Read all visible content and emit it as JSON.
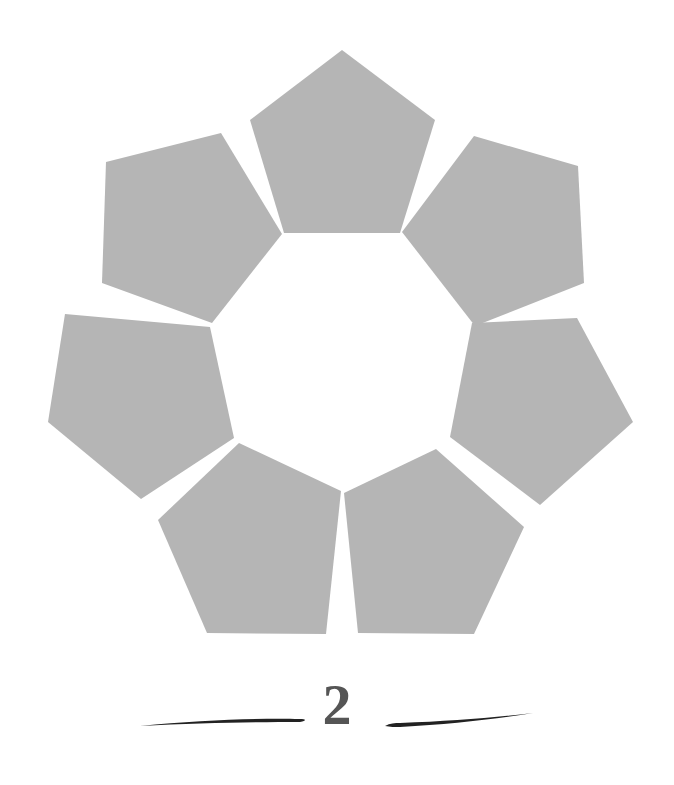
{
  "figure": {
    "shape": "pentagon",
    "count": 7,
    "fill_color": "#b5b5b5",
    "background_color": "#ffffff",
    "center": [
      341,
      335
    ],
    "pentagons": [
      {
        "points": "342,50 435,120 400,233 284,233 250,120"
      },
      {
        "points": "106,162 221,133 282,234 212,323 102,283"
      },
      {
        "points": "48,422 65,314 210,327 234,438 141,499"
      },
      {
        "points": "158,520 239,443 341,491 326,634 207,633"
      },
      {
        "points": "344,493 436,449 524,527 474,634 358,633"
      },
      {
        "points": "450,437 472,323 577,318 633,422 540,505"
      },
      {
        "points": "402,232 474,136 578,166 584,283 475,326"
      }
    ]
  },
  "footer": {
    "page_number": "2",
    "text_color": "#555555",
    "rule_color": "#222222"
  }
}
